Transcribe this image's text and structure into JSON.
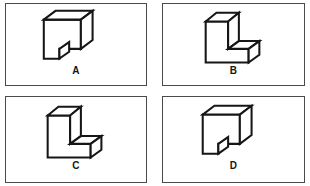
{
  "page": {
    "background_color": "#ffffff",
    "line_color": "#161616",
    "frame_color": "#4a4a4a"
  },
  "panels": [
    {
      "id": "A",
      "label": "A",
      "figure_name": "isometric-block-notch-lower-left",
      "description": "Rectangular block drawn in isometric projection with a small square notch cut from the lower left front face; top face and right side face visible."
    },
    {
      "id": "B",
      "label": "B",
      "figure_name": "isometric-l-block-step-lower-right",
      "description": "Tall L-shaped block in isometric projection with a step foot projecting to the lower right; top face and right side face visible."
    },
    {
      "id": "C",
      "label": "C",
      "figure_name": "isometric-l-block-step-lower-right-variant",
      "description": "Tall L-shaped block in isometric projection with a step foot projecting to the lower right, narrower upright than B."
    },
    {
      "id": "D",
      "label": "D",
      "figure_name": "isometric-block-notch-lower-left-variant",
      "description": "Rectangular block drawn in isometric projection with a small square notch cut from the lower left front face, same orientation as A."
    }
  ]
}
